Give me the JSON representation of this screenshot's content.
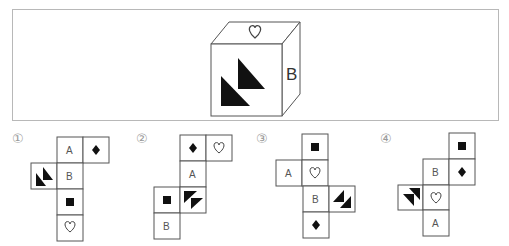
{
  "question": {
    "cube": {
      "top_face": "heart-outline",
      "front_face": "two-black-triangles",
      "right_face": "B",
      "right_label": "B"
    }
  },
  "options": [
    {
      "number_label": "①",
      "cells": [
        {
          "col": 1,
          "row": 0,
          "content": "A"
        },
        {
          "col": 2,
          "row": 0,
          "content": "diamond"
        },
        {
          "col": 0,
          "row": 1,
          "content": "triangles",
          "orientation": "right-angle-bottom-left"
        },
        {
          "col": 1,
          "row": 1,
          "content": "B"
        },
        {
          "col": 1,
          "row": 2,
          "content": "square"
        },
        {
          "col": 1,
          "row": 3,
          "content": "heart"
        }
      ]
    },
    {
      "number_label": "②",
      "cells": [
        {
          "col": 1,
          "row": 0,
          "content": "diamond"
        },
        {
          "col": 2,
          "row": 0,
          "content": "heart"
        },
        {
          "col": 1,
          "row": 1,
          "content": "A"
        },
        {
          "col": 0,
          "row": 2,
          "content": "square"
        },
        {
          "col": 1,
          "row": 2,
          "content": "triangles",
          "orientation": "right-angle-top-left"
        },
        {
          "col": 0,
          "row": 3,
          "content": "B"
        }
      ]
    },
    {
      "number_label": "③",
      "cells": [
        {
          "col": 1,
          "row": 0,
          "content": "square"
        },
        {
          "col": 0,
          "row": 1,
          "content": "A"
        },
        {
          "col": 1,
          "row": 1,
          "content": "heart"
        },
        {
          "col": 1,
          "row": 2,
          "content": "B"
        },
        {
          "col": 2,
          "row": 2,
          "content": "triangles",
          "orientation": "right-angle-bottom-right"
        },
        {
          "col": 1,
          "row": 3,
          "content": "diamond"
        }
      ]
    },
    {
      "number_label": "④",
      "cells": [
        {
          "col": 2,
          "row": 0,
          "content": "square"
        },
        {
          "col": 1,
          "row": 1,
          "content": "B"
        },
        {
          "col": 2,
          "row": 1,
          "content": "diamond"
        },
        {
          "col": 0,
          "row": 2,
          "content": "triangles",
          "orientation": "right-angle-top-right"
        },
        {
          "col": 1,
          "row": 2,
          "content": "heart"
        },
        {
          "col": 1,
          "row": 3,
          "content": "A"
        }
      ]
    }
  ],
  "labels": {
    "opt1": "①",
    "opt2": "②",
    "opt3": "③",
    "opt4": "④",
    "cube_B": "B",
    "n1_A": "A",
    "n1_B": "B",
    "n2_A": "A",
    "n2_B": "B",
    "n3_A": "A",
    "n3_B": "B",
    "n4_A": "A",
    "n4_B": "B"
  },
  "colors": {
    "line": "#555555",
    "fill": "#111111",
    "frame": "#b8b8b8",
    "number_label": "#9a9a9a"
  }
}
